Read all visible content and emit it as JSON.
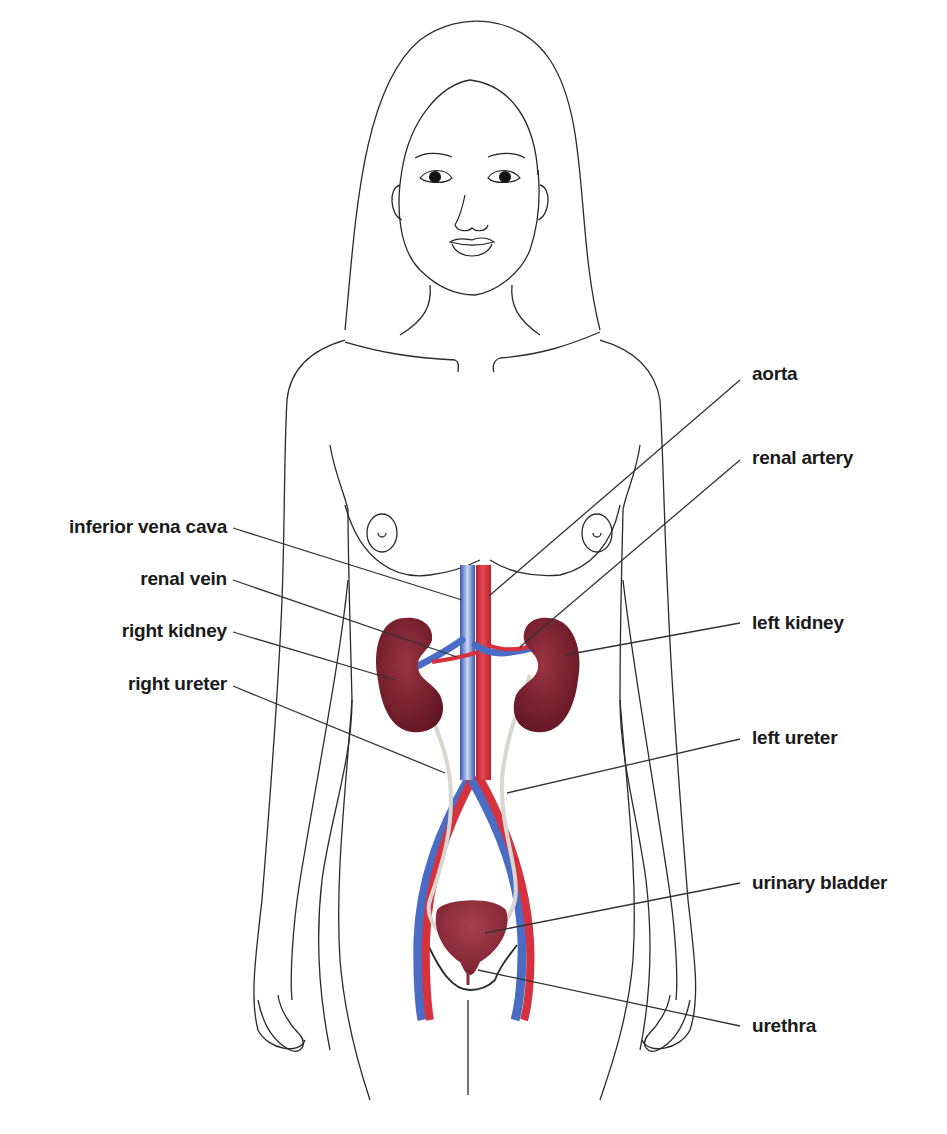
{
  "figure": {
    "colors": {
      "outline": "#2a2a2a",
      "artery": "#d6323e",
      "vein": "#4a6cc4",
      "kidney": "#7a1f2b",
      "bladder": "#8c2a3a",
      "ureter": "#d9d6d2",
      "leader_line": "#333333",
      "label_text": "#1a1a1a"
    }
  },
  "labels": {
    "left_side": [
      {
        "id": "inferior-vena-cava",
        "text": "inferior vena cava"
      },
      {
        "id": "renal-vein",
        "text": "renal vein"
      },
      {
        "id": "right-kidney",
        "text": "right kidney"
      },
      {
        "id": "right-ureter",
        "text": "right ureter"
      }
    ],
    "right_side": [
      {
        "id": "aorta",
        "text": "aorta"
      },
      {
        "id": "renal-artery",
        "text": "renal artery"
      },
      {
        "id": "left-kidney",
        "text": "left kidney"
      },
      {
        "id": "left-ureter",
        "text": "left ureter"
      },
      {
        "id": "urinary-bladder",
        "text": "urinary bladder"
      },
      {
        "id": "urethra",
        "text": "urethra"
      }
    ]
  }
}
